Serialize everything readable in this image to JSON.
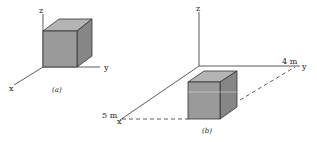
{
  "figure_a": {
    "caption": "(a)",
    "axes": {
      "x": "x",
      "y": "y",
      "z": "z"
    }
  },
  "figure_b": {
    "caption": "(b)",
    "axes": {
      "x": "x",
      "y": "y",
      "z": "z"
    },
    "dimensions": {
      "x_length": "5 m",
      "y_length": "4 m"
    }
  },
  "colors": {
    "cube_front": "#9a9a9a",
    "cube_top": "#b4b4b4",
    "cube_side": "#868686",
    "line": "#333333"
  }
}
